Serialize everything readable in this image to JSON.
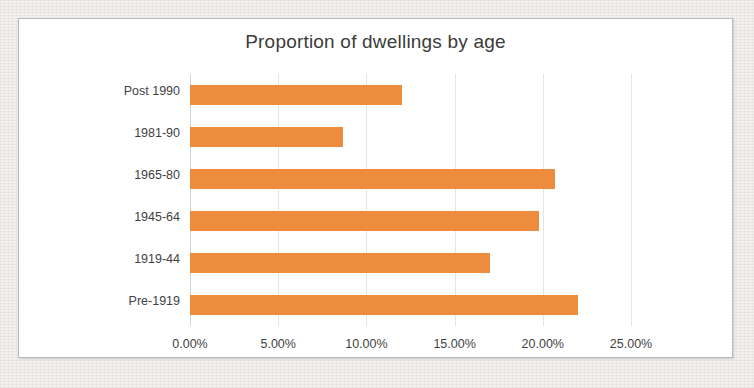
{
  "chart_data": {
    "type": "bar",
    "orientation": "horizontal",
    "title": "Proportion of dwellings by age",
    "xlabel": "",
    "ylabel": "",
    "categories": [
      "Post 1990",
      "1981-90",
      "1965-80",
      "1945-64",
      "1919-44",
      "Pre-1919"
    ],
    "values": [
      12.0,
      8.7,
      20.7,
      19.8,
      17.0,
      22.0
    ],
    "value_format": "percent",
    "xlim": [
      0,
      25
    ],
    "xticks": [
      0,
      5,
      10,
      15,
      20,
      25
    ],
    "xtick_labels": [
      "0.00%",
      "5.00%",
      "10.00%",
      "15.00%",
      "20.00%",
      "25.00%"
    ],
    "grid": "vertical",
    "legend": "none",
    "series": [
      {
        "name": "Proportion of dwellings",
        "color": "#ED8C3C",
        "values": [
          12.0,
          8.7,
          20.7,
          19.8,
          17.0,
          22.0
        ]
      }
    ]
  },
  "colors": {
    "bar": "#ED8C3C",
    "gridline": "#E4E4E4",
    "axis": "#D2D2D2",
    "text": "#3F3F3F",
    "title_text": "#3B3B3B",
    "plot_background": "#FFFFFF",
    "frame_border": "#B9B9B9",
    "page_background": "#F3F1EF"
  }
}
